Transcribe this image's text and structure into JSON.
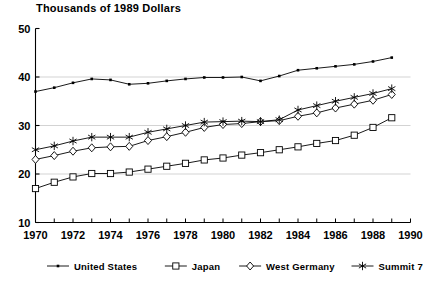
{
  "chart_data": {
    "type": "line",
    "title": "Thousands of 1989 Dollars",
    "xlabel": "",
    "ylabel": "",
    "xlim": [
      1970,
      1990
    ],
    "ylim": [
      10,
      50
    ],
    "ytick_values": [
      10,
      20,
      30,
      40,
      50
    ],
    "ytick_labels": [
      "10",
      "20",
      "30",
      "40",
      "50"
    ],
    "xtick_values": [
      1970,
      1972,
      1974,
      1976,
      1978,
      1980,
      1982,
      1984,
      1986,
      1988,
      1990
    ],
    "xtick_labels": [
      "1970",
      "1972",
      "1974",
      "1976",
      "1978",
      "1980",
      "1982",
      "1984",
      "1986",
      "1988",
      "1990"
    ],
    "xtick_minor_values": [
      1971,
      1973,
      1975,
      1977,
      1979,
      1981,
      1983,
      1985,
      1987,
      1989
    ],
    "grid": "horizontal",
    "legend_position": "bottom",
    "x": [
      1970,
      1971,
      1972,
      1973,
      1974,
      1975,
      1976,
      1977,
      1978,
      1979,
      1980,
      1981,
      1982,
      1983,
      1984,
      1985,
      1986,
      1987,
      1988,
      1989
    ],
    "series": [
      {
        "name": "United States",
        "marker": "dot",
        "color": "#000000",
        "values": [
          37.0,
          37.8,
          38.8,
          39.6,
          39.4,
          38.5,
          38.7,
          39.2,
          39.6,
          39.9,
          39.9,
          40.0,
          39.2,
          40.2,
          41.4,
          41.8,
          42.2,
          42.6,
          43.2,
          44.0
        ]
      },
      {
        "name": "Japan",
        "marker": "square",
        "color": "#000000",
        "values": [
          17.0,
          18.3,
          19.4,
          20.1,
          20.1,
          20.4,
          21.0,
          21.6,
          22.2,
          22.9,
          23.3,
          23.9,
          24.4,
          25.0,
          25.6,
          26.3,
          26.9,
          28.0,
          29.6,
          31.6
        ]
      },
      {
        "name": "West Germany",
        "marker": "diamond",
        "color": "#000000",
        "values": [
          23.0,
          23.8,
          24.7,
          25.4,
          25.6,
          25.7,
          26.9,
          27.7,
          28.6,
          29.6,
          30.2,
          30.4,
          30.8,
          31.0,
          31.9,
          32.6,
          33.6,
          34.4,
          35.2,
          36.4
        ]
      },
      {
        "name": "Summit 7",
        "marker": "asterisk",
        "color": "#000000",
        "values": [
          25.0,
          25.8,
          26.8,
          27.6,
          27.6,
          27.6,
          28.6,
          29.3,
          30.0,
          30.7,
          30.8,
          30.9,
          30.8,
          31.2,
          33.2,
          34.1,
          35.0,
          35.8,
          36.6,
          37.6
        ]
      }
    ]
  },
  "legend": {
    "items": [
      {
        "label": "United States",
        "marker": "dot"
      },
      {
        "label": "Japan",
        "marker": "square"
      },
      {
        "label": "West Germany",
        "marker": "diamond"
      },
      {
        "label": "Summit 7",
        "marker": "asterisk"
      }
    ]
  }
}
